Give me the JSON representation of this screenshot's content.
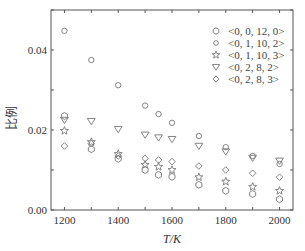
{
  "chart_data": {
    "type": "scatter",
    "title": "",
    "xlabel": "T/K",
    "ylabel": "比例",
    "xlim": [
      1150,
      2050
    ],
    "ylim": [
      0.0,
      0.05
    ],
    "xticks": [
      1200,
      1400,
      1600,
      1800,
      2000
    ],
    "xtick_labels": [
      "1200",
      "1400",
      "1600",
      "1800",
      "2000"
    ],
    "yticks": [
      0.0,
      0.02,
      0.04
    ],
    "ytick_labels": [
      "0.00",
      "0.02",
      "0.04"
    ],
    "grid": false,
    "legend_position": "upper right",
    "x": [
      1200,
      1300,
      1400,
      1500,
      1550,
      1600,
      1700,
      1800,
      1900,
      2000
    ],
    "series": [
      {
        "name": "<0, 0, 12, 0>",
        "marker": "hexagon",
        "values": [
          0.0235,
          0.0152,
          0.0128,
          0.01,
          0.0088,
          0.0083,
          0.0063,
          0.0048,
          0.004,
          0.0027
        ]
      },
      {
        "name": "<0, 1, 10, 2>",
        "marker": "circle",
        "values": [
          0.0448,
          0.0375,
          0.0312,
          0.0261,
          0.024,
          0.0218,
          0.0185,
          0.0157,
          0.0135,
          0.0115
        ]
      },
      {
        "name": "<0, 1, 10, 3>",
        "marker": "star",
        "values": [
          0.0198,
          0.017,
          0.014,
          0.0113,
          0.0108,
          0.01,
          0.0082,
          0.0071,
          0.0058,
          0.0048
        ]
      },
      {
        "name": "<0, 2, 8, 2>",
        "marker": "triangle-down",
        "values": [
          0.0225,
          0.0222,
          0.0202,
          0.0188,
          0.0181,
          0.0177,
          0.016,
          0.0146,
          0.013,
          0.0123
        ]
      },
      {
        "name": "<0, 2, 8, 3>",
        "marker": "diamond",
        "values": [
          0.016,
          0.0166,
          0.0135,
          0.0129,
          0.0125,
          0.0121,
          0.011,
          0.01,
          0.0092,
          0.0082
        ]
      }
    ]
  }
}
